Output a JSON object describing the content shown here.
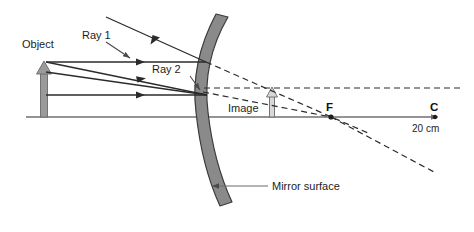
{
  "diagram": {
    "labels": {
      "object": "Object",
      "ray1": "Ray 1",
      "ray2": "Ray 2",
      "image": "Image",
      "focal_point": "F",
      "center_of_curvature": "C",
      "distance": "20 cm",
      "mirror_surface": "Mirror surface"
    },
    "colors": {
      "mirror_fill": "#8a8a8a",
      "mirror_stroke": "#3b3b3b",
      "object_fill": "#9a9a9a",
      "object_stroke": "#5a5a5a",
      "ray_stroke": "#2b2b2b",
      "axis_stroke": "#707070",
      "dashed_stroke": "#2b2b2b",
      "text": "#1d1d1d",
      "background": "#ffffff"
    },
    "geometry": {
      "principal_axis_y": 117,
      "axis_x_start": 26,
      "axis_x_end": 440,
      "object_x": 44,
      "object_tip_y": 62,
      "mirror_vertex_x": 207,
      "mirror_vertex_y": 95,
      "focal_point_x": 330,
      "center_x": 435,
      "image_x": 272,
      "image_tip_y": 88
    }
  }
}
